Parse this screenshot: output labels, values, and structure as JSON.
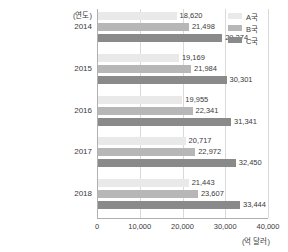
{
  "chart_data": {
    "type": "bar",
    "orientation": "horizontal",
    "title": "",
    "xlabel": "(억 달러)",
    "ylabel": "(연도)",
    "categories": [
      "2014",
      "2015",
      "2016",
      "2017",
      "2018"
    ],
    "series": [
      {
        "name": "A국",
        "color": "#e9e9e9",
        "values": [
          18620,
          19169,
          19955,
          20717,
          21443
        ],
        "labels": [
          "18,620",
          "19,169",
          "19,955",
          "20,717",
          "21,443"
        ]
      },
      {
        "name": "B국",
        "color": "#b7b7b7",
        "values": [
          21498,
          21984,
          22341,
          22972,
          23607
        ],
        "labels": [
          "21,498",
          "21,984",
          "22,341",
          "22,972",
          "23,607"
        ]
      },
      {
        "name": "C국",
        "color": "#8a8a8a",
        "values": [
          29274,
          30301,
          31341,
          32450,
          33444
        ],
        "labels": [
          "29,274",
          "30,301",
          "31,341",
          "32,450",
          "33,444"
        ]
      }
    ],
    "xlim": [
      0,
      40000
    ],
    "xticks": [
      0,
      10000,
      20000,
      30000,
      40000
    ],
    "xtick_labels": [
      "0",
      "10,000",
      "20,000",
      "30,000",
      "40,000"
    ],
    "grid": true,
    "legend_position": "top-right"
  },
  "legend": {
    "items": [
      {
        "label": "A국"
      },
      {
        "label": "B국"
      },
      {
        "label": "C국"
      }
    ]
  },
  "axes": {
    "y_axis_title": "(연도)",
    "x_axis_unit": "(억 달러)"
  }
}
